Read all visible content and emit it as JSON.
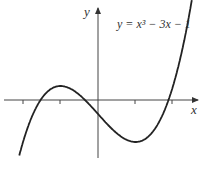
{
  "chart_data": {
    "type": "line",
    "xlabel": "x",
    "ylabel": "y",
    "equation_display": "y = x³ − 3x − 1",
    "x_ticks": [
      -2,
      -1,
      1,
      2
    ],
    "tick_labels_shown": false,
    "grid": false,
    "xlim": [
      -2.1,
      2.6
    ],
    "ylim": [
      -4.5,
      7
    ],
    "series": [
      {
        "name": "y = x^3 - 3x - 1",
        "x": [
          -2,
          -1.5,
          -1,
          -0.5,
          0,
          0.5,
          1,
          1.5,
          2,
          2.4
        ],
        "values": [
          -3,
          0.125,
          1,
          0.375,
          -1,
          -2.375,
          -3,
          -2.125,
          1,
          5.6
        ]
      }
    ],
    "key_points": {
      "local_max": [
        -1,
        1
      ],
      "local_min": [
        1,
        -3
      ],
      "y_intercept": [
        0,
        -1
      ]
    }
  },
  "labels": {
    "x": "x",
    "y": "y",
    "equation": "y = x³ − 3x − 1"
  }
}
